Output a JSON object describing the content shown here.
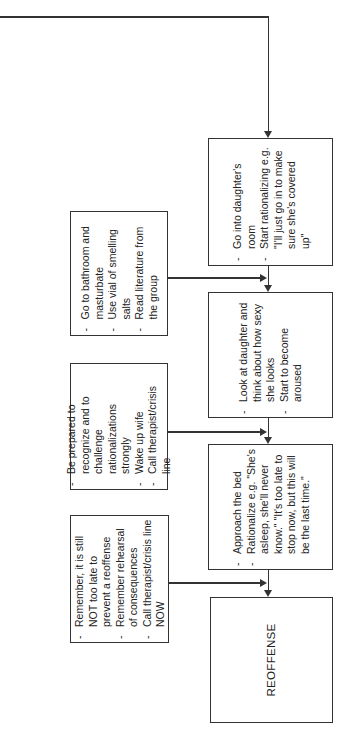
{
  "diagram": {
    "orientation": "rotated-90-ccw",
    "main_chain": [
      {
        "id": "daughters-room",
        "items": [
          "Go into daughter's room",
          "Start rationalizing e.g. \"I'll just go in to make sure she's covered up\""
        ]
      },
      {
        "id": "look-at-daughter",
        "items": [
          "Look at daughter and think about how sexy she looks",
          "Start to become aroused"
        ]
      },
      {
        "id": "approach-bed",
        "items": [
          "Approach the bed",
          "Rationalize e.g. \"She's asleep, she'll never know.\" \"It's too late to stop now, but this will be the last time.\""
        ]
      },
      {
        "id": "reoffense",
        "label": "REOFFENSE"
      }
    ],
    "interventions": [
      {
        "id": "bathroom",
        "items": [
          "Go to bathroom and masturbate",
          "Use vial of smelling salts",
          "Read literature from the group"
        ]
      },
      {
        "id": "challenge-rationalizations",
        "items": [
          "Be prepared to recognize and to challenge rationalizations strongly",
          "Wake up wife",
          "Call therapist/crisis line"
        ]
      },
      {
        "id": "remember",
        "items": [
          "Remember, it is still NOT too late to prevent a reoffense",
          "Remember rehearsal of consequences",
          "Call therapist/crisis line NOW"
        ]
      }
    ]
  }
}
